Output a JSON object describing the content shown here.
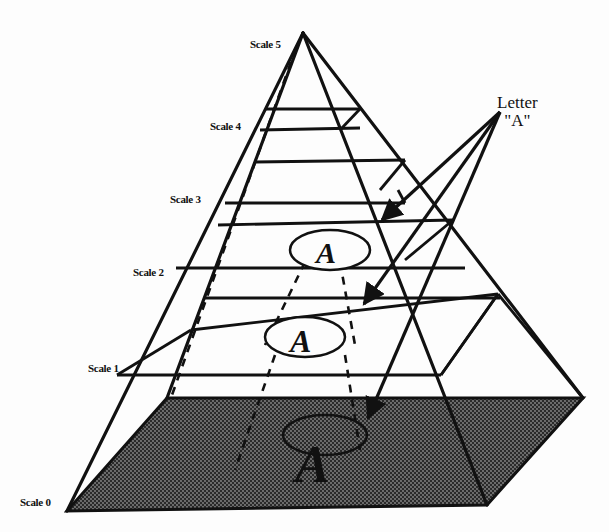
{
  "diagram": {
    "type": "image-pyramid",
    "scale_labels": [
      {
        "id": "scale-0",
        "text": "Scale 0"
      },
      {
        "id": "scale-1",
        "text": "Scale 1"
      },
      {
        "id": "scale-2",
        "text": "Scale 2"
      },
      {
        "id": "scale-3",
        "text": "Scale 3"
      },
      {
        "id": "scale-4",
        "text": "Scale 4"
      },
      {
        "id": "scale-5",
        "text": "Scale 5"
      }
    ],
    "callout": {
      "line1": "Letter",
      "line2": "\"A\""
    },
    "letter_glyph": "A",
    "letter_instances": 3,
    "colors": {
      "ink": "#111111",
      "base_fill": "#3a3a3a",
      "background": "#fdfdfd"
    }
  }
}
